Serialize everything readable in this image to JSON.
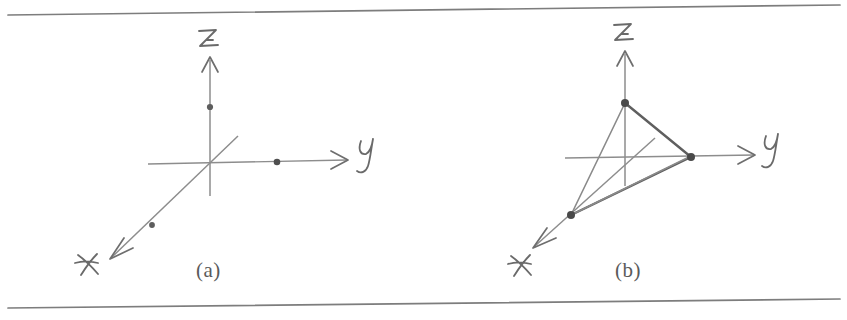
{
  "figure": {
    "medium": "pencil sketch on ruled paper (photocopy)",
    "background_color": "#ffffff",
    "ink_color": "#6e6e6e",
    "ink_color_dark": "#4a4a4a",
    "rule_color": "#7d7d7d"
  },
  "rules": {
    "top": {
      "x1": 8,
      "y1": 15,
      "x2": 840,
      "y2": 5
    },
    "bottom": {
      "x1": 8,
      "y1": 308,
      "x2": 840,
      "y2": 299
    }
  },
  "panels": [
    {
      "id": "a",
      "caption": "(a)",
      "caption_position": {
        "x": 196,
        "y": 258
      },
      "origin": {
        "x": 210,
        "y": 163
      },
      "axes": [
        {
          "name": "z",
          "label": "z",
          "label_position": {
            "x": 203,
            "y": 38
          },
          "line": {
            "x1": 210,
            "y1": 196,
            "x2": 210,
            "y2": 58
          },
          "arrow_tip": {
            "x": 210,
            "y": 58
          }
        },
        {
          "name": "y",
          "label": "y",
          "label_position": {
            "x": 365,
            "y": 148
          },
          "line": {
            "x1": 148,
            "y1": 164,
            "x2": 345,
            "y2": 160
          },
          "arrow_tip": {
            "x": 345,
            "y": 160
          }
        },
        {
          "name": "x",
          "label": "x",
          "label_position": {
            "x": 83,
            "y": 261
          },
          "line": {
            "x1": 236,
            "y1": 137,
            "x2": 110,
            "y2": 258
          },
          "arrow_tip": {
            "x": 110,
            "y": 258
          }
        }
      ],
      "points": [
        {
          "name": "point-on-z",
          "x": 210,
          "y": 107,
          "axis": "z"
        },
        {
          "name": "point-on-y",
          "x": 277,
          "y": 162,
          "axis": "y"
        },
        {
          "name": "point-on-x",
          "x": 152,
          "y": 225,
          "axis": "x"
        }
      ],
      "edges": []
    },
    {
      "id": "b",
      "caption": "(b)",
      "caption_position": {
        "x": 615,
        "y": 258
      },
      "origin": {
        "x": 625,
        "y": 157
      },
      "axes": [
        {
          "name": "z",
          "label": "z",
          "label_position": {
            "x": 618,
            "y": 32
          },
          "line": {
            "x1": 625,
            "y1": 186,
            "x2": 625,
            "y2": 52
          },
          "arrow_tip": {
            "x": 625,
            "y": 52
          }
        },
        {
          "name": "y",
          "label": "y",
          "label_position": {
            "x": 770,
            "y": 143
          },
          "line": {
            "x1": 565,
            "y1": 157,
            "x2": 752,
            "y2": 155
          },
          "arrow_tip": {
            "x": 752,
            "y": 155
          }
        },
        {
          "name": "x",
          "label": "x",
          "label_position": {
            "x": 516,
            "y": 262
          },
          "line": {
            "x1": 653,
            "y1": 140,
            "x2": 533,
            "y2": 247
          },
          "arrow_tip": {
            "x": 533,
            "y": 247
          }
        }
      ],
      "points": [
        {
          "name": "vertex-on-z",
          "x": 625,
          "y": 103,
          "axis": "z"
        },
        {
          "name": "vertex-on-y",
          "x": 690,
          "y": 157,
          "axis": "y"
        },
        {
          "name": "vertex-on-x",
          "x": 571,
          "y": 215,
          "axis": "x"
        }
      ],
      "edges": [
        {
          "name": "edge-z-to-y",
          "x1": 625,
          "y1": 103,
          "x2": 690,
          "y2": 157
        },
        {
          "name": "edge-y-to-x",
          "x1": 690,
          "y1": 157,
          "x2": 571,
          "y2": 215
        },
        {
          "name": "edge-x-to-z",
          "x1": 571,
          "y1": 215,
          "x2": 625,
          "y2": 103
        },
        {
          "name": "edge-x-to-origin-extension",
          "x1": 571,
          "y1": 215,
          "x2": 690,
          "y2": 157
        }
      ]
    }
  ]
}
